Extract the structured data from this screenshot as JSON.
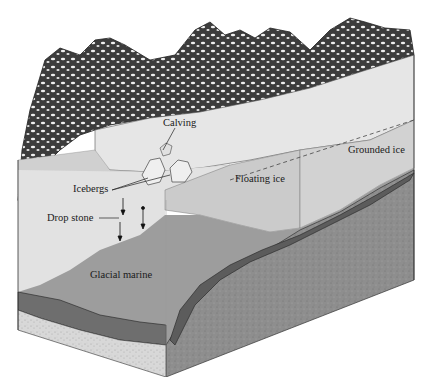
{
  "diagram": {
    "labels": {
      "calving": "Calving",
      "icebergs": "Icebergs",
      "drop_stone": "Drop stone",
      "floating_ice": "Floating ice",
      "grounded_ice": "Grounded ice",
      "glacial_marine": "Glacial marine"
    },
    "colors": {
      "background": "#ffffff",
      "mountains_dark": "#3a3a3a",
      "snow": "#f2f2f2",
      "glacier_surface": "#e4e4e4",
      "water_light": "#dcdcdc",
      "floating_ice": "#c9c9c9",
      "glacial_marine": "#9a9a9a",
      "bedrock": "#8c8c8c",
      "till_layer": "#6e6e6e",
      "sand_base": "#d6d6d6"
    }
  }
}
